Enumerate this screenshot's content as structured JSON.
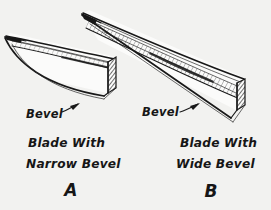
{
  "figure": {
    "title": "Blade bevel comparison diagram",
    "background_color": "#f2f2f0",
    "ink_color": "#181818",
    "style": "hand-drawn pen and ink line illustration"
  },
  "blade_a": {
    "id": "A",
    "letter": "A",
    "bevel_label": "Bevel",
    "caption_line1": "Blade With",
    "caption_line2": "Narrow Bevel",
    "bevel_type": "narrow",
    "orientation": "tip points to the left, curved belly, hatched end face at right"
  },
  "blade_b": {
    "id": "B",
    "letter": "B",
    "bevel_label": "Bevel",
    "caption_line1": "Blade With",
    "caption_line2": "Wide Bevel",
    "bevel_type": "wide",
    "orientation": "tip points to the upper left, long diagonal body, hatched end face at lower right"
  }
}
